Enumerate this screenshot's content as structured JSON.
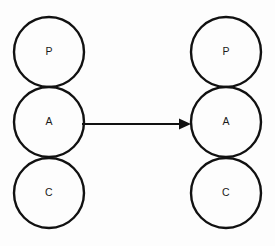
{
  "diagram": {
    "type": "node-graph",
    "background_color": "#fdfdfd",
    "stroke_color": "#111111",
    "label_color": "#1a1a1a",
    "groups": [
      {
        "name": "left-stack",
        "center_x": 49,
        "nodes": [
          {
            "id": "left-p",
            "label": "P",
            "cx": 49,
            "cy": 52,
            "r": 35
          },
          {
            "id": "left-a",
            "label": "A",
            "cx": 49,
            "cy": 122,
            "r": 35
          },
          {
            "id": "left-c",
            "label": "C",
            "cx": 49,
            "cy": 193,
            "r": 35
          }
        ]
      },
      {
        "name": "right-stack",
        "center_x": 226,
        "nodes": [
          {
            "id": "right-p",
            "label": "P",
            "cx": 226,
            "cy": 52,
            "r": 35
          },
          {
            "id": "right-a",
            "label": "A",
            "cx": 226,
            "cy": 122,
            "r": 35
          },
          {
            "id": "right-c",
            "label": "C",
            "cx": 226,
            "cy": 193,
            "r": 35
          }
        ]
      }
    ],
    "edges": [
      {
        "id": "edge-left-a-to-right-a",
        "label": "",
        "from": "left-a",
        "to": "right-a",
        "x1": 82,
        "y1": 124,
        "x2": 191,
        "y2": 124,
        "arrowhead": "solid-triangle"
      }
    ]
  }
}
